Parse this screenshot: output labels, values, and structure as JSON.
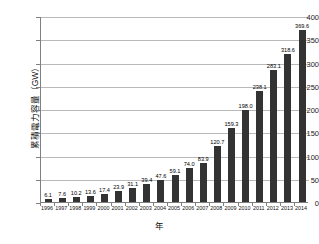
{
  "chart_data": {
    "type": "bar",
    "title": "",
    "xlabel": "年",
    "ylabel": "累積電力容量（GW）",
    "ylim": [
      0,
      400
    ],
    "yticks": [
      0,
      50,
      100,
      150,
      200,
      250,
      300,
      350,
      400
    ],
    "grid": true,
    "legend": "none",
    "bar_color": "#333333",
    "categories": [
      "1996",
      "1997",
      "1998",
      "1999",
      "2000",
      "2001",
      "2002",
      "2003",
      "2004",
      "2005",
      "2006",
      "2007",
      "2008",
      "2009",
      "2010",
      "2011",
      "2012",
      "2013",
      "2014"
    ],
    "values": [
      6.1,
      7.6,
      10.2,
      13.6,
      17.4,
      23.9,
      31.1,
      39.4,
      47.6,
      59.1,
      74.0,
      83.9,
      120.7,
      159.3,
      198.0,
      238.1,
      283.1,
      318.6,
      369.6
    ],
    "value_labels": [
      "6.1",
      "7.6",
      "10.2",
      "13.6",
      "17.4",
      "23.9",
      "31.1",
      "39.4",
      "47.6",
      "59.1",
      "74.0",
      "83.9",
      "120.7",
      "159.3",
      "198.0",
      "238.1",
      "283.1",
      "318.6",
      "369.6"
    ]
  }
}
